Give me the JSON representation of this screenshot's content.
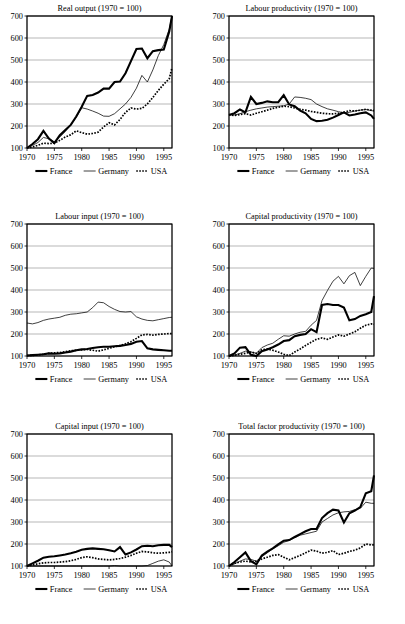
{
  "figure": {
    "title": "",
    "axis": {
      "y_ticks": [
        100,
        200,
        300,
        400,
        500,
        600,
        700
      ],
      "x_ticks": [
        1970,
        1975,
        1980,
        1985,
        1990,
        1995
      ],
      "xlim": [
        1970,
        1996.5
      ],
      "ylim": [
        100,
        700
      ]
    },
    "legend": {
      "france_label": "France",
      "germany_label": "Germany",
      "usa_label": "USA"
    },
    "colors": {
      "france": "#000000",
      "germany": "#000000",
      "usa": "#000000",
      "gridline": "#9a9a9a",
      "frame": "#000000",
      "background": "#ffffff"
    }
  },
  "chart_data": [
    {
      "id": "real-output",
      "type": "line",
      "title": "Real output (1970  = 100)",
      "xlabel": "",
      "ylabel": "",
      "xlim": [
        1970,
        1996.5
      ],
      "ylim": [
        100,
        700
      ],
      "grid": true,
      "legend_position": "below",
      "x": [
        1970,
        1971,
        1972,
        1973,
        1974,
        1975,
        1976,
        1977,
        1978,
        1979,
        1980,
        1981,
        1982,
        1983,
        1984,
        1985,
        1986,
        1987,
        1988,
        1989,
        1990,
        1991,
        1992,
        1993,
        1994,
        1995,
        1996,
        1996.5
      ],
      "series": [
        {
          "name": "France",
          "values": [
            100,
            118,
            140,
            178,
            143,
            122,
            158,
            182,
            205,
            243,
            288,
            337,
            341,
            352,
            370,
            370,
            400,
            402,
            440,
            495,
            550,
            552,
            508,
            540,
            545,
            548,
            630,
            700
          ]
        },
        {
          "name": "Germany",
          "values": [
            100,
            112,
            125,
            148,
            142,
            128,
            150,
            175,
            205,
            240,
            283,
            277,
            268,
            258,
            245,
            244,
            256,
            278,
            300,
            330,
            372,
            430,
            400,
            455,
            520,
            570,
            640,
            705
          ]
        },
        {
          "name": "USA",
          "values": [
            100,
            105,
            112,
            122,
            120,
            122,
            135,
            150,
            160,
            178,
            170,
            163,
            166,
            172,
            196,
            215,
            205,
            230,
            262,
            282,
            277,
            280,
            300,
            330,
            362,
            390,
            415,
            465
          ]
        }
      ]
    },
    {
      "id": "labour-productivity",
      "type": "line",
      "title": "Labour productivity (1970  = 100)",
      "xlabel": "",
      "ylabel": "",
      "xlim": [
        1970,
        1996.5
      ],
      "ylim": [
        100,
        700
      ],
      "grid": true,
      "legend_position": "below",
      "x": [
        1970,
        1971,
        1972,
        1973,
        1974,
        1975,
        1976,
        1977,
        1978,
        1979,
        1980,
        1981,
        1982,
        1983,
        1984,
        1985,
        1986,
        1987,
        1988,
        1989,
        1990,
        1991,
        1992,
        1993,
        1994,
        1995,
        1996,
        1996.5
      ],
      "series": [
        {
          "name": "France",
          "values": [
            250,
            258,
            275,
            262,
            332,
            300,
            305,
            312,
            308,
            308,
            340,
            298,
            290,
            270,
            258,
            232,
            222,
            224,
            228,
            238,
            250,
            262,
            248,
            252,
            258,
            262,
            248,
            232
          ]
        },
        {
          "name": "Germany",
          "values": [
            252,
            250,
            256,
            265,
            272,
            278,
            282,
            286,
            288,
            290,
            292,
            300,
            332,
            330,
            326,
            320,
            300,
            288,
            278,
            272,
            265,
            260,
            262,
            268,
            272,
            275,
            270,
            268
          ]
        },
        {
          "name": "USA",
          "values": [
            252,
            248,
            252,
            256,
            250,
            258,
            265,
            272,
            280,
            285,
            290,
            288,
            282,
            276,
            272,
            266,
            262,
            258,
            256,
            255,
            258,
            262,
            270,
            268,
            272,
            276,
            272,
            270
          ]
        }
      ]
    },
    {
      "id": "labour-input",
      "type": "line",
      "title": "Labour input (1970  = 100)",
      "xlabel": "",
      "ylabel": "",
      "xlim": [
        1970,
        1996.5
      ],
      "ylim": [
        100,
        700
      ],
      "grid": true,
      "legend_position": "below",
      "x": [
        1970,
        1971,
        1972,
        1973,
        1974,
        1975,
        1976,
        1977,
        1978,
        1979,
        1980,
        1981,
        1982,
        1983,
        1984,
        1985,
        1986,
        1987,
        1988,
        1989,
        1990,
        1991,
        1992,
        1993,
        1994,
        1995,
        1996,
        1996.5
      ],
      "series": [
        {
          "name": "France",
          "values": [
            102,
            104,
            106,
            108,
            112,
            110,
            112,
            116,
            120,
            126,
            130,
            132,
            136,
            140,
            142,
            142,
            144,
            146,
            150,
            155,
            165,
            168,
            135,
            130,
            128,
            126,
            124,
            124
          ]
        },
        {
          "name": "Germany",
          "values": [
            250,
            246,
            252,
            262,
            268,
            272,
            276,
            285,
            290,
            292,
            296,
            300,
            320,
            345,
            342,
            325,
            312,
            302,
            300,
            302,
            278,
            268,
            262,
            260,
            265,
            270,
            275,
            276
          ]
        },
        {
          "name": "USA",
          "values": [
            102,
            103,
            105,
            108,
            112,
            114,
            116,
            120,
            124,
            126,
            128,
            130,
            126,
            122,
            128,
            135,
            142,
            148,
            155,
            165,
            180,
            196,
            198,
            195,
            198,
            200,
            202,
            202
          ]
        }
      ]
    },
    {
      "id": "capital-productivity",
      "type": "line",
      "title": "Capital productivity (1970  = 100)",
      "xlabel": "",
      "ylabel": "",
      "xlim": [
        1970,
        1996.5
      ],
      "ylim": [
        100,
        700
      ],
      "grid": true,
      "legend_position": "below",
      "x": [
        1970,
        1971,
        1972,
        1973,
        1974,
        1975,
        1976,
        1977,
        1978,
        1979,
        1980,
        1981,
        1982,
        1983,
        1984,
        1985,
        1986,
        1987,
        1988,
        1989,
        1990,
        1991,
        1992,
        1993,
        1994,
        1995,
        1996,
        1996.5
      ],
      "series": [
        {
          "name": "France",
          "values": [
            100,
            112,
            138,
            140,
            105,
            100,
            122,
            130,
            140,
            152,
            168,
            172,
            190,
            196,
            200,
            222,
            208,
            332,
            336,
            332,
            332,
            320,
            262,
            268,
            282,
            290,
            300,
            372
          ]
        },
        {
          "name": "Germany",
          "values": [
            100,
            104,
            112,
            122,
            118,
            112,
            138,
            150,
            158,
            176,
            192,
            190,
            200,
            208,
            212,
            240,
            262,
            352,
            398,
            440,
            462,
            428,
            465,
            480,
            420,
            462,
            500,
            498
          ]
        },
        {
          "name": "USA",
          "values": [
            100,
            103,
            108,
            112,
            118,
            112,
            128,
            132,
            126,
            118,
            108,
            102,
            118,
            132,
            148,
            162,
            176,
            182,
            176,
            186,
            196,
            190,
            200,
            210,
            226,
            240,
            246,
            244
          ]
        }
      ]
    },
    {
      "id": "capital-input",
      "type": "line",
      "title": "Capital input (1970  = 100)",
      "xlabel": "",
      "ylabel": "",
      "xlim": [
        1970,
        1996.5
      ],
      "ylim": [
        100,
        700
      ],
      "grid": true,
      "legend_position": "below",
      "x": [
        1970,
        1971,
        1972,
        1973,
        1974,
        1975,
        1976,
        1977,
        1978,
        1979,
        1980,
        1981,
        1982,
        1983,
        1984,
        1985,
        1986,
        1987,
        1988,
        1989,
        1990,
        1991,
        1992,
        1993,
        1994,
        1995,
        1996,
        1996.5
      ],
      "series": [
        {
          "name": "France",
          "values": [
            100,
            112,
            124,
            138,
            142,
            144,
            148,
            152,
            158,
            165,
            174,
            178,
            180,
            178,
            176,
            172,
            166,
            186,
            152,
            162,
            175,
            190,
            192,
            190,
            194,
            196,
            196,
            186
          ]
        },
        {
          "name": "Germany",
          "values": [
            100,
            100,
            100,
            100,
            100,
            100,
            100,
            100,
            100,
            100,
            100,
            100,
            100,
            100,
            100,
            100,
            102,
            100,
            100,
            100,
            100,
            100,
            102,
            112,
            122,
            128,
            118,
            100
          ]
        },
        {
          "name": "USA",
          "values": [
            100,
            104,
            110,
            114,
            116,
            116,
            118,
            120,
            124,
            130,
            138,
            142,
            138,
            132,
            130,
            128,
            130,
            134,
            140,
            148,
            158,
            166,
            164,
            160,
            158,
            160,
            162,
            165
          ]
        }
      ]
    },
    {
      "id": "total-factor-productivity",
      "type": "line",
      "title": "Total factor productivity (1970  = 100)",
      "xlabel": "",
      "ylabel": "",
      "xlim": [
        1970,
        1996.5
      ],
      "ylim": [
        100,
        700
      ],
      "grid": true,
      "legend_position": "below",
      "x": [
        1970,
        1971,
        1972,
        1973,
        1974,
        1975,
        1976,
        1977,
        1978,
        1979,
        1980,
        1981,
        1982,
        1983,
        1984,
        1985,
        1986,
        1987,
        1988,
        1989,
        1990,
        1991,
        1992,
        1993,
        1994,
        1995,
        1996,
        1996.5
      ],
      "series": [
        {
          "name": "France",
          "values": [
            100,
            118,
            140,
            162,
            122,
            108,
            148,
            165,
            180,
            198,
            215,
            218,
            232,
            245,
            258,
            268,
            268,
            318,
            340,
            356,
            352,
            298,
            340,
            352,
            368,
            430,
            440,
            512
          ]
        },
        {
          "name": "Germany",
          "values": [
            100,
            110,
            122,
            132,
            130,
            122,
            142,
            160,
            178,
            192,
            208,
            216,
            228,
            240,
            246,
            252,
            258,
            300,
            316,
            332,
            342,
            346,
            348,
            356,
            362,
            390,
            385,
            385
          ]
        },
        {
          "name": "USA",
          "values": [
            100,
            112,
            118,
            122,
            118,
            122,
            132,
            140,
            148,
            152,
            140,
            128,
            138,
            148,
            160,
            172,
            168,
            158,
            162,
            170,
            152,
            158,
            166,
            172,
            182,
            200,
            196,
            196
          ]
        }
      ]
    }
  ]
}
